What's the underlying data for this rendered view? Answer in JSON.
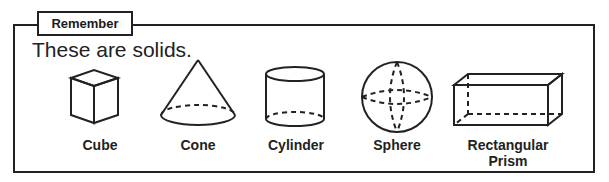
{
  "box": {
    "tag": "Remember",
    "lead": "These are solids."
  },
  "solids": [
    {
      "name": "Cube",
      "icon": "cube-icon"
    },
    {
      "name": "Cone",
      "icon": "cone-icon"
    },
    {
      "name": "Cylinder",
      "icon": "cylinder-icon"
    },
    {
      "name": "Sphere",
      "icon": "sphere-icon"
    },
    {
      "name": "Rectangular Prism",
      "icon": "rectangular-prism-icon"
    }
  ]
}
